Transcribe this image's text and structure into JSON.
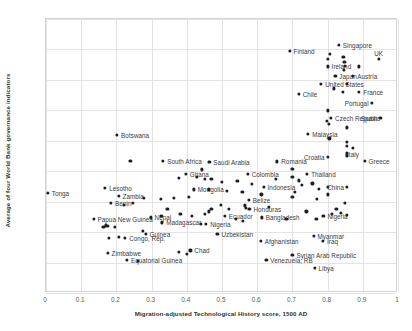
{
  "chart_data": {
    "type": "scatter",
    "title": "",
    "xlabel": "Migration-adjusted Technological History score, 1500 AD",
    "ylabel": "Average of four World Bank governance indicators",
    "xlim": [
      0,
      1
    ],
    "ylim": [
      -2,
      2.5
    ],
    "xticks": [
      "0",
      "0.1",
      "0.2",
      "0.3",
      "0.4",
      "0.5",
      "0.6",
      "0.7",
      "0.8",
      "0.9",
      "1"
    ],
    "yticks": [
      "2.5",
      "2",
      "1.5",
      "1",
      "0.5",
      "0",
      "-0.5",
      "-1",
      "-1.5",
      "-2"
    ],
    "grid": true,
    "legend": "none",
    "marker_color": "#1f1f1f",
    "points": [
      {
        "label": "Tonga",
        "x": 0.005,
        "y": -0.36,
        "lp": "right"
      },
      {
        "label": "Botswana",
        "x": 0.202,
        "y": 0.6,
        "lp": "right"
      },
      {
        "label": "South Africa",
        "x": 0.333,
        "y": 0.17,
        "lp": "right"
      },
      {
        "label": "Saudi Arabia",
        "x": 0.464,
        "y": 0.15,
        "lp": "right"
      },
      {
        "label": "Romania",
        "x": 0.657,
        "y": 0.16,
        "lp": "right"
      },
      {
        "label": "Croatia",
        "x": 0.8,
        "y": 0.23,
        "lp": "left"
      },
      {
        "label": "Italy",
        "x": 0.872,
        "y": 0.38,
        "lp": "below"
      },
      {
        "label": "Greece",
        "x": 0.905,
        "y": 0.17,
        "lp": "right"
      },
      {
        "label": "Ghana",
        "x": 0.397,
        "y": -0.04,
        "lp": "right"
      },
      {
        "label": "Colombia",
        "x": 0.573,
        "y": -0.04,
        "lp": "right"
      },
      {
        "label": "Thailand",
        "x": 0.742,
        "y": -0.04,
        "lp": "right"
      },
      {
        "label": "Mongolia",
        "x": 0.42,
        "y": -0.3,
        "lp": "right"
      },
      {
        "label": "Indonesia",
        "x": 0.618,
        "y": -0.26,
        "lp": "right"
      },
      {
        "label": "China",
        "x": 0.855,
        "y": -0.26,
        "lp": "left"
      },
      {
        "label": "Lesotho",
        "x": 0.168,
        "y": -0.28,
        "lp": "right"
      },
      {
        "label": "Zambia",
        "x": 0.206,
        "y": -0.4,
        "lp": "right"
      },
      {
        "label": "Benin",
        "x": 0.185,
        "y": -0.52,
        "lp": "right"
      },
      {
        "label": "Belize",
        "x": 0.576,
        "y": -0.47,
        "lp": "right"
      },
      {
        "label": "Papua New Guinea",
        "x": 0.135,
        "y": -0.78,
        "lp": "right"
      },
      {
        "label": "Nepal",
        "x": 0.297,
        "y": -0.76,
        "lp": "right"
      },
      {
        "label": "Honduras",
        "x": 0.578,
        "y": -0.62,
        "lp": "right"
      },
      {
        "label": "Ecuador",
        "x": 0.508,
        "y": -0.74,
        "lp": "right"
      },
      {
        "label": "Bangladesh",
        "x": 0.613,
        "y": -0.76,
        "lp": "right"
      },
      {
        "label": "Madagascar",
        "x": 0.33,
        "y": -0.84,
        "lp": "right"
      },
      {
        "label": "Nigeria",
        "x": 0.788,
        "y": -0.74,
        "lp": "right"
      },
      {
        "label": "Nigeria ",
        "x": 0.455,
        "y": -0.86,
        "lp": "right"
      },
      {
        "label": "Guinea",
        "x": 0.283,
        "y": -1.03,
        "lp": "right"
      },
      {
        "label": "Congo, Rep.",
        "x": 0.225,
        "y": -1.09,
        "lp": "right"
      },
      {
        "label": "Uzbekistan",
        "x": 0.487,
        "y": -1.03,
        "lp": "right"
      },
      {
        "label": "Myanmar",
        "x": 0.76,
        "y": -1.06,
        "lp": "right"
      },
      {
        "label": "Afghanistan",
        "x": 0.61,
        "y": -1.14,
        "lp": "right"
      },
      {
        "label": "Iraq",
        "x": 0.787,
        "y": -1.15,
        "lp": "right"
      },
      {
        "label": "Chad",
        "x": 0.41,
        "y": -1.3,
        "lp": "right"
      },
      {
        "label": "Zimbabwe",
        "x": 0.175,
        "y": -1.34,
        "lp": "right"
      },
      {
        "label": "Equatorial Guinea",
        "x": 0.23,
        "y": -1.46,
        "lp": "right"
      },
      {
        "label": "Syrian Arab Republic",
        "x": 0.7,
        "y": -1.37,
        "lp": "right"
      },
      {
        "label": "Venezuela, RB",
        "x": 0.626,
        "y": -1.45,
        "lp": "right"
      },
      {
        "label": "Libya",
        "x": 0.763,
        "y": -1.59,
        "lp": "right"
      },
      {
        "label": "Finland",
        "x": 0.692,
        "y": 1.98,
        "lp": "right"
      },
      {
        "label": "Singapore",
        "x": 0.832,
        "y": 2.07,
        "lp": "right"
      },
      {
        "label": "UK",
        "x": 0.945,
        "y": 1.85,
        "lp": "above"
      },
      {
        "label": "Ireland",
        "x": 0.8,
        "y": 1.72,
        "lp": "right"
      },
      {
        "label": "Japan",
        "x": 0.822,
        "y": 1.56,
        "lp": "right"
      },
      {
        "label": "Austria",
        "x": 0.873,
        "y": 1.56,
        "lp": "right"
      },
      {
        "label": "United States",
        "x": 0.782,
        "y": 1.44,
        "lp": "right"
      },
      {
        "label": "France",
        "x": 0.89,
        "y": 1.3,
        "lp": "right"
      },
      {
        "label": "Chile",
        "x": 0.718,
        "y": 1.27,
        "lp": "right"
      },
      {
        "label": "Portugal",
        "x": 0.925,
        "y": 1.12,
        "lp": "left"
      },
      {
        "label": "Czech Republic",
        "x": 0.81,
        "y": 0.88,
        "lp": "right"
      },
      {
        "label": "Spain",
        "x": 0.95,
        "y": 0.87,
        "lp": "left"
      },
      {
        "label": "Malaysia",
        "x": 0.745,
        "y": 0.61,
        "lp": "right"
      },
      {
        "label": "",
        "x": 0.24,
        "y": 0.17,
        "lp": "none"
      },
      {
        "label": "",
        "x": 0.378,
        "y": -0.11,
        "lp": "none"
      },
      {
        "label": "",
        "x": 0.428,
        "y": -0.09,
        "lp": "none"
      },
      {
        "label": "",
        "x": 0.452,
        "y": -0.12,
        "lp": "none"
      },
      {
        "label": "",
        "x": 0.47,
        "y": -0.13,
        "lp": "none"
      },
      {
        "label": "",
        "x": 0.443,
        "y": 0.03,
        "lp": "none"
      },
      {
        "label": "",
        "x": 0.5,
        "y": -0.17,
        "lp": "none"
      },
      {
        "label": "",
        "x": 0.544,
        "y": -0.16,
        "lp": "none"
      },
      {
        "label": "",
        "x": 0.585,
        "y": -0.21,
        "lp": "none"
      },
      {
        "label": "",
        "x": 0.652,
        "y": -0.13,
        "lp": "none"
      },
      {
        "label": "",
        "x": 0.7,
        "y": -0.1,
        "lp": "none"
      },
      {
        "label": "",
        "x": 0.718,
        "y": -0.15,
        "lp": "none"
      },
      {
        "label": "",
        "x": 0.726,
        "y": -0.22,
        "lp": "none"
      },
      {
        "label": "",
        "x": 0.757,
        "y": -0.2,
        "lp": "none"
      },
      {
        "label": "",
        "x": 0.775,
        "y": -0.29,
        "lp": "none"
      },
      {
        "label": "",
        "x": 0.8,
        "y": -0.26,
        "lp": "none"
      },
      {
        "label": "",
        "x": 0.706,
        "y": -0.34,
        "lp": "none"
      },
      {
        "label": "",
        "x": 0.612,
        "y": -0.38,
        "lp": "none"
      },
      {
        "label": "",
        "x": 0.7,
        "y": -0.42,
        "lp": "none"
      },
      {
        "label": "",
        "x": 0.77,
        "y": -0.46,
        "lp": "none"
      },
      {
        "label": "",
        "x": 0.8,
        "y": -0.38,
        "lp": "none"
      },
      {
        "label": "",
        "x": 0.85,
        "y": -0.52,
        "lp": "none"
      },
      {
        "label": "",
        "x": 0.825,
        "y": -0.62,
        "lp": "none"
      },
      {
        "label": "",
        "x": 0.74,
        "y": -0.66,
        "lp": "none"
      },
      {
        "label": "",
        "x": 0.812,
        "y": -0.7,
        "lp": "none"
      },
      {
        "label": "",
        "x": 0.838,
        "y": -0.68,
        "lp": "none"
      },
      {
        "label": "",
        "x": 0.856,
        "y": -0.72,
        "lp": "none"
      },
      {
        "label": "",
        "x": 0.768,
        "y": -0.78,
        "lp": "none"
      },
      {
        "label": "",
        "x": 0.683,
        "y": -0.78,
        "lp": "none"
      },
      {
        "label": "",
        "x": 0.56,
        "y": -0.82,
        "lp": "none"
      },
      {
        "label": "",
        "x": 0.54,
        "y": -0.78,
        "lp": "none"
      },
      {
        "label": "",
        "x": 0.345,
        "y": -0.62,
        "lp": "none"
      },
      {
        "label": "",
        "x": 0.363,
        "y": -0.44,
        "lp": "none"
      },
      {
        "label": "",
        "x": 0.405,
        "y": -0.42,
        "lp": "none"
      },
      {
        "label": "",
        "x": 0.327,
        "y": -0.45,
        "lp": "none"
      },
      {
        "label": "",
        "x": 0.278,
        "y": -0.44,
        "lp": "none"
      },
      {
        "label": "",
        "x": 0.222,
        "y": -0.55,
        "lp": "none"
      },
      {
        "label": "",
        "x": 0.248,
        "y": -0.52,
        "lp": "none"
      },
      {
        "label": "",
        "x": 0.17,
        "y": -0.89,
        "lp": "none"
      },
      {
        "label": "",
        "x": 0.176,
        "y": -0.9,
        "lp": "none"
      },
      {
        "label": "",
        "x": 0.163,
        "y": -0.91,
        "lp": "none"
      },
      {
        "label": "",
        "x": 0.196,
        "y": -0.91,
        "lp": "none"
      },
      {
        "label": "",
        "x": 0.178,
        "y": -1.1,
        "lp": "none"
      },
      {
        "label": "",
        "x": 0.275,
        "y": -0.98,
        "lp": "none"
      },
      {
        "label": "",
        "x": 0.208,
        "y": -1.08,
        "lp": "none"
      },
      {
        "label": "",
        "x": 0.378,
        "y": -1.33,
        "lp": "none"
      },
      {
        "label": "",
        "x": 0.4,
        "y": -1.36,
        "lp": "none"
      },
      {
        "label": "",
        "x": 0.26,
        "y": -1.47,
        "lp": "none"
      },
      {
        "label": "",
        "x": 0.44,
        "y": -0.86,
        "lp": "none"
      },
      {
        "label": "",
        "x": 0.452,
        "y": -0.7,
        "lp": "none"
      },
      {
        "label": "",
        "x": 0.463,
        "y": -0.66,
        "lp": "none"
      },
      {
        "label": "",
        "x": 0.47,
        "y": -0.62,
        "lp": "none"
      },
      {
        "label": "",
        "x": 0.498,
        "y": -0.55,
        "lp": "none"
      },
      {
        "label": "",
        "x": 0.52,
        "y": -0.62,
        "lp": "none"
      },
      {
        "label": "",
        "x": 0.567,
        "y": -0.6,
        "lp": "none"
      },
      {
        "label": "",
        "x": 0.565,
        "y": -0.56,
        "lp": "none"
      },
      {
        "label": "",
        "x": 0.633,
        "y": -0.58,
        "lp": "none"
      },
      {
        "label": "",
        "x": 0.382,
        "y": -0.7,
        "lp": "none"
      },
      {
        "label": "",
        "x": 0.414,
        "y": -0.73,
        "lp": "none"
      },
      {
        "label": "",
        "x": 0.513,
        "y": -0.32,
        "lp": "none"
      },
      {
        "label": "",
        "x": 0.558,
        "y": -0.34,
        "lp": "none"
      },
      {
        "label": "",
        "x": 0.462,
        "y": -0.3,
        "lp": "none"
      },
      {
        "label": "",
        "x": 0.328,
        "y": -0.74,
        "lp": "none"
      },
      {
        "label": "",
        "x": 0.806,
        "y": 1.93,
        "lp": "none"
      },
      {
        "label": "",
        "x": 0.8,
        "y": 1.85,
        "lp": "none"
      },
      {
        "label": "",
        "x": 0.845,
        "y": 1.88,
        "lp": "none"
      },
      {
        "label": "",
        "x": 0.848,
        "y": 1.8,
        "lp": "none"
      },
      {
        "label": "",
        "x": 0.85,
        "y": 1.73,
        "lp": "none"
      },
      {
        "label": "",
        "x": 0.846,
        "y": 1.66,
        "lp": "none"
      },
      {
        "label": "",
        "x": 0.89,
        "y": 1.72,
        "lp": "none"
      },
      {
        "label": "",
        "x": 0.855,
        "y": 1.44,
        "lp": "none"
      },
      {
        "label": "",
        "x": 0.818,
        "y": 1.36,
        "lp": "none"
      },
      {
        "label": "",
        "x": 0.843,
        "y": 1.3,
        "lp": "none"
      },
      {
        "label": "",
        "x": 0.8,
        "y": 1.0,
        "lp": "none"
      },
      {
        "label": "",
        "x": 0.798,
        "y": 0.82,
        "lp": "none"
      },
      {
        "label": "",
        "x": 0.803,
        "y": 0.78,
        "lp": "none"
      },
      {
        "label": "",
        "x": 0.855,
        "y": 0.72,
        "lp": "none"
      },
      {
        "label": "",
        "x": 0.805,
        "y": 0.54,
        "lp": "none"
      },
      {
        "label": "",
        "x": 0.855,
        "y": 0.48,
        "lp": "none"
      },
      {
        "label": "",
        "x": 0.856,
        "y": 0.42,
        "lp": "none"
      },
      {
        "label": "",
        "x": 0.856,
        "y": 0.3,
        "lp": "none"
      },
      {
        "label": "",
        "x": 0.855,
        "y": 0.26,
        "lp": "none"
      },
      {
        "label": "",
        "x": 0.7,
        "y": 0.04,
        "lp": "none"
      }
    ]
  }
}
